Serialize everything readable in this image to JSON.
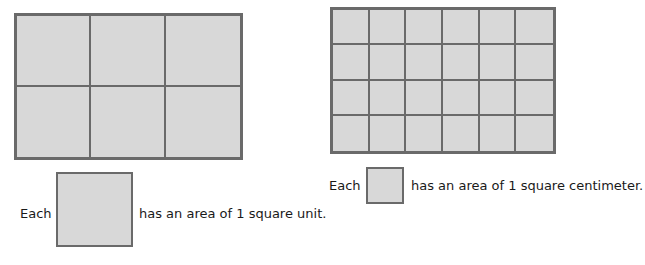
{
  "figures": [
    {
      "name": "square-units-rectangle",
      "rows": 2,
      "columns": 3,
      "caption_prefix": "Each",
      "caption_suffix": "has an area of 1 square unit."
    },
    {
      "name": "square-centimeters-rectangle",
      "rows": 4,
      "columns": 6,
      "caption_prefix": "Each",
      "caption_suffix": "has an area of 1 square centimeter."
    }
  ],
  "colors": {
    "fill": "#d8d8d8",
    "stroke": "#6a6a6a",
    "text": "#1a1a1a"
  }
}
